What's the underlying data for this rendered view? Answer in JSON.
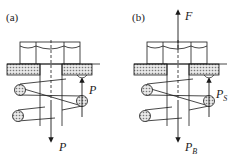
{
  "figure": {
    "panels": [
      {
        "id": "a",
        "label": "(a)",
        "forces": {
          "spring_force_label": "P",
          "bolt_force_label": "P"
        }
      },
      {
        "id": "b",
        "label": "(b)",
        "forces": {
          "external_force_label": "F",
          "spring_force_label": "P",
          "spring_force_sub": "S",
          "bolt_force_label": "P",
          "bolt_force_sub": "B"
        }
      }
    ],
    "components": [
      "hex-nut",
      "plate",
      "bolt",
      "coil-spring"
    ],
    "colors": {
      "line": "#1a1a1a",
      "hatch_fill": "#bdbdbd",
      "background": "#ffffff"
    }
  }
}
